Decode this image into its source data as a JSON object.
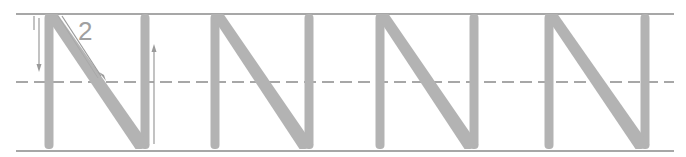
{
  "worksheet": {
    "letter": "N",
    "repetitions": 4,
    "colors": {
      "guide_line": "#8a8a8a",
      "letter_fill": "#b3b3b3",
      "arrow": "#9a9a9a",
      "stroke_number": "#a0a0a0",
      "background": "#ffffff"
    },
    "guides": {
      "top_y": 14,
      "mid_y": 82,
      "bottom_y": 151,
      "x_start": 16,
      "x_end": 674
    },
    "stroke_order": [
      {
        "number": "1",
        "direction": "down",
        "description": "left vertical stem"
      },
      {
        "number": "2",
        "direction": "diagonal-down-right",
        "description": "diagonal stroke"
      },
      {
        "number": "",
        "direction": "up",
        "description": "right vertical stem"
      }
    ],
    "letters": [
      {
        "left_x": 49,
        "right_x": 145
      },
      {
        "left_x": 215,
        "right_x": 309
      },
      {
        "left_x": 380,
        "right_x": 474
      },
      {
        "left_x": 549,
        "right_x": 645
      }
    ]
  }
}
